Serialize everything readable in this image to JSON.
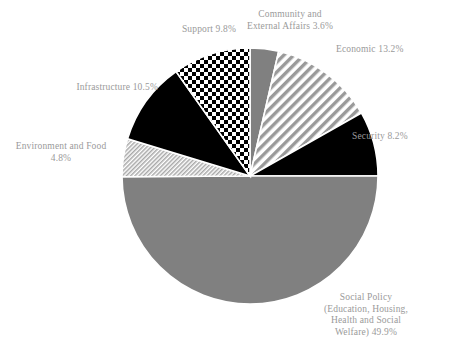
{
  "figure": {
    "cut_off_title": "",
    "background_color": "#ffffff",
    "label_color": "#9a9a9a"
  },
  "chart_data": {
    "type": "pie",
    "title": "",
    "xlabel": "",
    "ylabel": "",
    "legend_position": "none",
    "grid": false,
    "total": 100.0,
    "start_angle_deg": 0,
    "direction": "clockwise",
    "center_px": [
      250,
      176
    ],
    "radius_px": 128,
    "categories": [
      "Community and External Affairs",
      "Economic",
      "Security",
      "Social Policy (Education, Housing, Health and Social Welfare)",
      "Environment and Food",
      "Infrastructure",
      "Support"
    ],
    "values": [
      3.6,
      13.2,
      8.2,
      49.9,
      4.8,
      10.5,
      9.8
    ],
    "slices": [
      {
        "name": "Community and External Affairs",
        "value": 3.6,
        "label": "Community and\nExternal Affairs 3.6%",
        "fill": "solid-gray",
        "color": "#808080",
        "start_deg": 0.0,
        "end_deg": 12.96
      },
      {
        "name": "Economic",
        "value": 13.2,
        "label": "Economic 13.2%",
        "fill": "diagonal-stripes",
        "color": "#9a9a9a",
        "start_deg": 12.96,
        "end_deg": 60.48
      },
      {
        "name": "Security",
        "value": 8.2,
        "label": "Security 8.2%",
        "fill": "solid-black",
        "color": "#000000",
        "start_deg": 60.48,
        "end_deg": 90.0
      },
      {
        "name": "Social Policy (Education, Housing, Health and Social Welfare)",
        "value": 49.9,
        "label": "Social Policy\n(Education, Housing,\nHealth and Social\nWelfare) 49.9%",
        "fill": "solid-gray",
        "color": "#808080",
        "start_deg": 90.0,
        "end_deg": 269.64
      },
      {
        "name": "Environment and Food",
        "value": 4.8,
        "label": "Environment and Food\n4.8%",
        "fill": "fine-hatch",
        "color": "#b4b4b4",
        "start_deg": 269.64,
        "end_deg": 286.92
      },
      {
        "name": "Infrastructure",
        "value": 10.5,
        "label": "Infrastructure 10.5%",
        "fill": "solid-black",
        "color": "#000000",
        "start_deg": 286.92,
        "end_deg": 324.72
      },
      {
        "name": "Support",
        "value": 9.8,
        "label": "Support 9.8%",
        "fill": "checkerboard",
        "color": "#000000",
        "start_deg": 324.72,
        "end_deg": 360.0
      }
    ]
  }
}
